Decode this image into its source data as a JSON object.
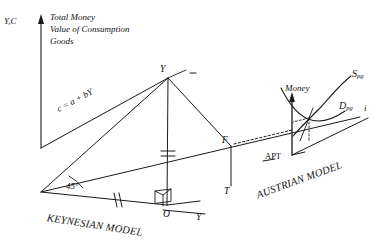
{
  "diagram": {
    "title_note": "Keynesian and Austrian model comparison diagram",
    "vertical_axis_label": "Y,C",
    "axis_caption_line1": "Total Money",
    "axis_caption_line2": "Value of Consumption",
    "axis_caption_line3": "Goods",
    "consumption_function": "c = a + bY",
    "angle_label": "45°",
    "apex_label": "Y",
    "origin_label": "O",
    "horizontal_axis_label": "Y",
    "point_f_label": "F",
    "point_t_label": "T",
    "apt_label": "APT",
    "money_axis_label": "Money",
    "supply_curve_label": "S",
    "supply_curve_subscript": "pg",
    "demand_curve_label": "D",
    "demand_curve_subscript": "pg",
    "interest_axis_label": "i",
    "keynesian_model_name": "KEYNESIAN MODEL",
    "austrian_model_name": "AUSTRIAN MODEL"
  },
  "colors": {
    "ink": "#1a1a1a",
    "paper": "#ffffff"
  }
}
